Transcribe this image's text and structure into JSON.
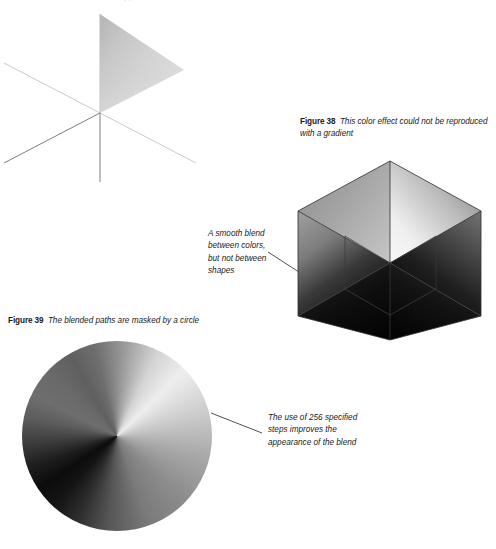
{
  "document": {
    "background_color": "#ffffff",
    "text_color": "#1a1a1a",
    "top_clipped_caption_fragment": "with the blend tool applied"
  },
  "figures": [
    {
      "id": "figure-37",
      "number": "",
      "caption": "",
      "artwork": "gradient-triangle-with-isometric-axes",
      "description": "A single gradient-filled triangle whose apex sits at the intersection of three thin isometric guide lines"
    },
    {
      "id": "figure-38",
      "number": "Figure 38",
      "caption": "This color effect could not be reproduced with a gradient",
      "artwork": "isometric-cube-conic-blend",
      "description": "An isometric cube built from six blended triangular paths"
    },
    {
      "id": "figure-39",
      "number": "Figure 39",
      "caption": "The blended paths are masked by a circle",
      "artwork": "conic-blend-circle",
      "description": "The same blended paths clipped to a circular mask"
    }
  ],
  "captions": {
    "figure38": {
      "label": "Figure 38",
      "line1": "This color effect could not be reproduced",
      "line2": "with a gradient"
    },
    "figure39": {
      "label": "Figure 39",
      "line1": "The blended paths are masked by a circle"
    }
  },
  "annotations": {
    "cube_note": {
      "lines": [
        "A smooth blend",
        "between colors,",
        "but not between",
        "shapes"
      ],
      "leader": "line pointing right toward the cube's left face"
    },
    "circle_note": {
      "lines": [
        "The use of 256 specified",
        "steps improves the",
        "appearance of the blend"
      ],
      "leader": "line pointing left toward the circle's right edge"
    }
  },
  "colors": {
    "page_background": "#ffffff",
    "caption_text": "#1a1a1a",
    "leader_line": "#3c3c3c",
    "axis_line_light": "#bdbdbd",
    "axis_line_dark": "#6f6f6f",
    "triangle_light": "#d9d9d9",
    "triangle_mid": "#a9a9a9",
    "cube_highlight": "#f2f2f2",
    "cube_shadow": "#0b0b0b",
    "circle_highlight": "#eeeeee",
    "circle_shadow": "#0c0c0c"
  },
  "artwork_geometry": {
    "figure37": {
      "center": [
        100,
        113
      ],
      "triangle_points": "100,14 100,113 184,70",
      "axes": [
        {
          "name": "vertical-axis",
          "from": [
            100,
            14
          ],
          "to": [
            100,
            182
          ],
          "tone": "dark"
        },
        {
          "name": "axis-up-left",
          "from": [
            100,
            113
          ],
          "to": [
            4,
            63
          ],
          "tone": "light"
        },
        {
          "name": "axis-down-left",
          "from": [
            100,
            113
          ],
          "to": [
            4,
            163
          ],
          "tone": "dark"
        },
        {
          "name": "axis-down-right",
          "from": [
            100,
            113
          ],
          "to": [
            196,
            163
          ],
          "tone": "light"
        }
      ]
    },
    "figure38": {
      "center": [
        110,
        113
      ],
      "vertices": {
        "top": [
          110,
          11
        ],
        "upper_left": [
          18,
          61
        ],
        "upper_right": [
          201,
          61
        ],
        "lower_left": [
          18,
          166
        ],
        "lower_right": [
          201,
          166
        ],
        "bottom": [
          110,
          190
        ]
      }
    },
    "figure39": {
      "circle_center": [
        99,
        100
      ],
      "circle_radius": 95
    }
  }
}
